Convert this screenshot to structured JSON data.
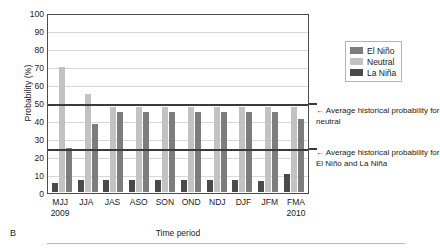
{
  "panel": {
    "label": "B"
  },
  "chart_data": {
    "type": "bar",
    "title": "",
    "xlabel": "Time period",
    "ylabel": "Probability (%)",
    "ylim": [
      0,
      100
    ],
    "ytick_step": 10,
    "yticks": [
      100,
      90,
      80,
      70,
      60,
      50,
      40,
      30,
      20,
      10,
      0
    ],
    "grid": true,
    "legend_position": "right",
    "categories": [
      "MJJ",
      "JJA",
      "JAS",
      "ASO",
      "SON",
      "OND",
      "NDJ",
      "DJF",
      "JFM",
      "FMA"
    ],
    "category_years": [
      "2009",
      "",
      "",
      "",
      "",
      "",
      "",
      "",
      "",
      "2010"
    ],
    "series": [
      {
        "name": "El Niño",
        "color": "#7d7d7d",
        "values": [
          25,
          38,
          45,
          45,
          45,
          45,
          45,
          45,
          45,
          41
        ]
      },
      {
        "name": "Neutral",
        "color": "#c2c2c2",
        "values": [
          70,
          55,
          48,
          48,
          48,
          48,
          48,
          48,
          48,
          48
        ]
      },
      {
        "name": "La Niña",
        "color": "#4a4a4a",
        "values": [
          5,
          7,
          7,
          7,
          7,
          7,
          7,
          7,
          6,
          10
        ]
      }
    ],
    "series_order_in_group": [
      "La Niña",
      "Neutral",
      "El Niño"
    ],
    "reference_lines": [
      {
        "name": "average-historical-neutral",
        "value": 50,
        "color": "#3b3b3b"
      },
      {
        "name": "average-historical-elnino-lanina",
        "value": 25,
        "color": "#3b3b3b"
      }
    ],
    "annotations": [
      {
        "name": "neutral-annotation",
        "text": "← Average historical probability for neutral",
        "at_value": 50
      },
      {
        "name": "enso-annotation",
        "text": "← Average historical probability for El Niño and La Niña",
        "at_value": 25
      }
    ]
  },
  "legend": {
    "items": [
      {
        "label": "El Niño",
        "color": "#7d7d7d"
      },
      {
        "label": "Neutral",
        "color": "#c2c2c2"
      },
      {
        "label": "La Niña",
        "color": "#4a4a4a"
      }
    ]
  }
}
